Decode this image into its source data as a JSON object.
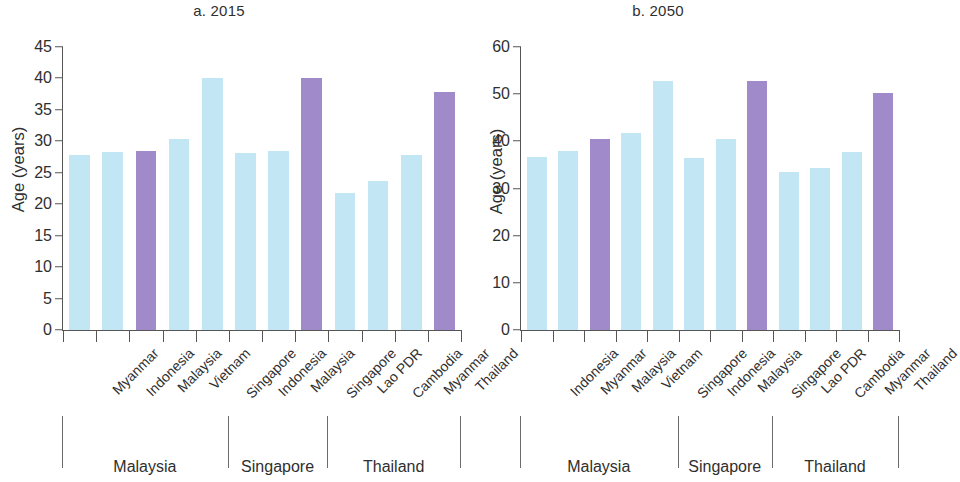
{
  "figure": {
    "ylabel": "Age (years)",
    "colors": {
      "light": "#c3e6f4",
      "purple": "#a18ac9",
      "axis": "#555555",
      "text": "#2f2f2f"
    }
  },
  "chart_data": [
    {
      "type": "bar",
      "title": "a. 2015",
      "xlabel": "",
      "ylabel": "Age (years)",
      "ylim": [
        0,
        45
      ],
      "yticks": [
        0,
        5,
        10,
        15,
        20,
        25,
        30,
        35,
        40,
        45
      ],
      "grid": false,
      "legend": "none",
      "categories": [
        "Myanmar",
        "Indonesia",
        "Malaysia",
        "Vietnam",
        "Singapore",
        "Indonesia",
        "Malaysia",
        "Singapore",
        "Lao PDR",
        "Cambodia",
        "Myanmar",
        "Thailand"
      ],
      "values": [
        27.9,
        28.3,
        28.5,
        30.4,
        40.0,
        28.2,
        28.4,
        40.0,
        21.8,
        23.7,
        27.8,
        37.8
      ],
      "bar_colors": [
        "light",
        "light",
        "purple",
        "light",
        "light",
        "light",
        "light",
        "purple",
        "light",
        "light",
        "light",
        "purple"
      ],
      "groups": [
        {
          "label": "Malaysia",
          "start": 0,
          "end": 4
        },
        {
          "label": "Singapore",
          "start": 5,
          "end": 7
        },
        {
          "label": "Thailand",
          "start": 8,
          "end": 11
        }
      ]
    },
    {
      "type": "bar",
      "title": "b. 2050",
      "xlabel": "",
      "ylabel": "Age (years)",
      "ylim": [
        0,
        60
      ],
      "yticks": [
        0,
        10,
        20,
        30,
        40,
        50,
        60
      ],
      "grid": false,
      "legend": "none",
      "categories": [
        "Indonesia",
        "Myanmar",
        "Malaysia",
        "Vietnam",
        "Singapore",
        "Indonesia",
        "Malaysia",
        "Singapore",
        "Lao PDR",
        "Cambodia",
        "Myanmar",
        "Thailand"
      ],
      "values": [
        36.6,
        38.0,
        40.6,
        41.8,
        52.8,
        36.5,
        40.5,
        52.8,
        33.5,
        34.3,
        37.8,
        50.3
      ],
      "bar_colors": [
        "light",
        "light",
        "purple",
        "light",
        "light",
        "light",
        "light",
        "purple",
        "light",
        "light",
        "light",
        "purple"
      ],
      "groups": [
        {
          "label": "Malaysia",
          "start": 0,
          "end": 4
        },
        {
          "label": "Singapore",
          "start": 5,
          "end": 7
        },
        {
          "label": "Thailand",
          "start": 8,
          "end": 11
        }
      ]
    }
  ]
}
